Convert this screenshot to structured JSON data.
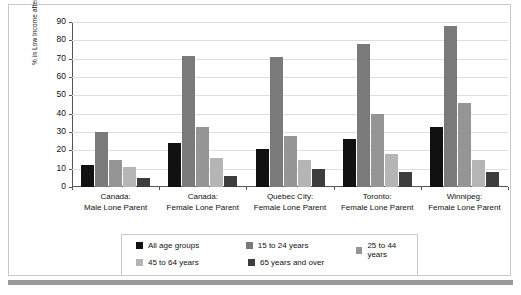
{
  "chart_data": {
    "type": "bar",
    "title": "",
    "subtitle": "",
    "xlabel": "",
    "ylabel": "% in Low Income after Tax",
    "ylim": [
      0,
      90
    ],
    "ytick_values": [
      90,
      80,
      70,
      60,
      50,
      40,
      30,
      20,
      10,
      0
    ],
    "grid": true,
    "legend_position": "bottom",
    "categories": [
      "Canada: Male Lone Parent",
      "Canada: Female Lone Parent",
      "Quebec City: Female Lone Parent",
      "Toronto: Female Lone Parent",
      "Winnipeg: Female Lone Parent"
    ],
    "category_lines": [
      {
        "line1": "Canada:",
        "line2": "Male Lone Parent"
      },
      {
        "line1": "Canada:",
        "line2": "Female Lone Parent"
      },
      {
        "line1": "Quebec City:",
        "line2": "Female Lone Parent"
      },
      {
        "line1": "Toronto:",
        "line2": "Female Lone Parent"
      },
      {
        "line1": "Winnipeg:",
        "line2": "Female Lone Parent"
      }
    ],
    "series": [
      {
        "name": "All age groups",
        "color": "#111111",
        "values": [
          12,
          24,
          21,
          26,
          33
        ]
      },
      {
        "name": "15 to 24 years",
        "color": "#7a7a7a",
        "values": [
          30,
          71.5,
          71,
          78,
          88
        ]
      },
      {
        "name": "25 to 44 years",
        "color": "#959595",
        "values": [
          15,
          33,
          28,
          40,
          46
        ]
      },
      {
        "name": "45 to 64 years",
        "color": "#b5b5b5",
        "values": [
          11,
          16,
          15,
          18,
          15
        ]
      },
      {
        "name": "65 years and over",
        "color": "#3d3d3d",
        "values": [
          5,
          6,
          10,
          8,
          8
        ]
      }
    ]
  },
  "legend": {
    "rows": [
      [
        {
          "label": "All age groups",
          "color": "#111111"
        },
        {
          "label": "15 to 24 years",
          "color": "#7a7a7a"
        },
        {
          "label": "25 to 44 years",
          "color": "#959595"
        }
      ],
      [
        {
          "label": "45 to 64 years",
          "color": "#b5b5b5"
        },
        {
          "label": "65 years and over",
          "color": "#3d3d3d"
        }
      ]
    ]
  },
  "colors": {
    "panel_border": "#c9c9c9",
    "gridline": "#dedede",
    "axis": "#555555",
    "bottom_rule": "#9a9a9a",
    "text": "#111111"
  }
}
